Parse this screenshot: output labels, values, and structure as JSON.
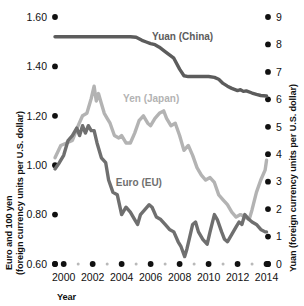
{
  "chart_data": {
    "type": "line",
    "title": "",
    "xlabel": "Year",
    "ylabel_left": "Euro and 100 yen (foreign currency units per U.S. dollar)",
    "ylabel_left_line1": "Euro and 100 yen",
    "ylabel_left_line2": "(foreign currency units per U.S. dollar)",
    "ylabel_right": "Yuan (foreign currency units per U.S. dollar)",
    "grid": false,
    "legend_position": "inline-annotations",
    "xlim": [
      1999.4,
      2014.1
    ],
    "x_major_ticks": [
      2000,
      2002,
      2004,
      2006,
      2008,
      2010,
      2012,
      2014
    ],
    "x_major_tick_labels": [
      "2000",
      "2002",
      "2004",
      "2006",
      "2008",
      "2010",
      "2012",
      "2014"
    ],
    "x_minor_ticks": [
      2001,
      2003,
      2005,
      2007,
      2009,
      2011,
      2013
    ],
    "x_edge_ticks": [
      1999.4,
      2014.1
    ],
    "ylim_left": [
      0.6,
      1.6
    ],
    "y_left_ticks": [
      0.6,
      0.8,
      1.0,
      1.2,
      1.4,
      1.6
    ],
    "y_left_tick_labels": [
      "0.60",
      "0.80",
      "1.00",
      "1.20",
      "1.40",
      "1.60"
    ],
    "ylim_right": [
      0,
      9
    ],
    "y_right_ticks": [
      0,
      1,
      2,
      3,
      4,
      5,
      6,
      7,
      8,
      9
    ],
    "y_right_tick_labels": [
      "0",
      "1",
      "2",
      "3",
      "4",
      "5",
      "6",
      "7",
      "8",
      "9"
    ],
    "series": [
      {
        "name": "Yuan (China)",
        "axis": "right",
        "color": "#5c5c5c",
        "label": "Yuan (China)",
        "label_x": 2006.1,
        "label_y": 8.15,
        "x": [
          1999.4,
          2000.0,
          2001.0,
          2002.0,
          2003.0,
          2004.0,
          2004.6,
          2005.0,
          2005.4,
          2005.7,
          2006.0,
          2006.3,
          2006.6,
          2007.0,
          2007.3,
          2007.6,
          2008.0,
          2008.3,
          2008.6,
          2009.0,
          2009.5,
          2010.0,
          2010.4,
          2010.7,
          2011.0,
          2011.3,
          2011.6,
          2012.0,
          2012.2,
          2012.4,
          2012.6,
          2013.0,
          2013.3,
          2013.6,
          2014.0
        ],
        "y": [
          8.28,
          8.28,
          8.28,
          8.28,
          8.28,
          8.28,
          8.28,
          8.26,
          8.15,
          8.09,
          8.03,
          7.99,
          7.9,
          7.74,
          7.62,
          7.5,
          7.1,
          6.86,
          6.83,
          6.83,
          6.83,
          6.83,
          6.8,
          6.73,
          6.58,
          6.48,
          6.4,
          6.32,
          6.35,
          6.29,
          6.31,
          6.23,
          6.18,
          6.14,
          6.12
        ]
      },
      {
        "name": "Yen (Japan)",
        "axis": "left",
        "color": "#b3b3b3",
        "label": "Yen (Japan)",
        "label_x": 2004.1,
        "label_y": 1.255,
        "x": [
          1999.4,
          1999.8,
          2000.2,
          2000.6,
          2001.0,
          2001.3,
          2001.6,
          2001.9,
          2002.1,
          2002.25,
          2002.4,
          2002.6,
          2002.8,
          2003.0,
          2003.2,
          2003.5,
          2003.8,
          2004.0,
          2004.3,
          2004.6,
          2004.9,
          2005.2,
          2005.5,
          2005.8,
          2006.0,
          2006.3,
          2006.6,
          2006.9,
          2007.1,
          2007.4,
          2007.7,
          2008.0,
          2008.3,
          2008.6,
          2008.9,
          2009.2,
          2009.5,
          2009.8,
          2010.1,
          2010.4,
          2010.7,
          2011.0,
          2011.3,
          2011.6,
          2011.9,
          2012.2,
          2012.5,
          2012.8,
          2013.0,
          2013.3,
          2013.6,
          2013.9,
          2014.0
        ],
        "y": [
          1.03,
          1.08,
          1.09,
          1.1,
          1.16,
          1.2,
          1.21,
          1.27,
          1.32,
          1.26,
          1.29,
          1.25,
          1.21,
          1.19,
          1.17,
          1.12,
          1.11,
          1.12,
          1.09,
          1.09,
          1.13,
          1.18,
          1.2,
          1.17,
          1.16,
          1.19,
          1.21,
          1.22,
          1.19,
          1.16,
          1.17,
          1.12,
          1.06,
          1.08,
          1.04,
          0.99,
          0.96,
          0.94,
          0.95,
          0.93,
          0.88,
          0.86,
          0.84,
          0.81,
          0.79,
          0.8,
          0.79,
          0.78,
          0.82,
          0.89,
          0.94,
          0.98,
          1.02
        ]
      },
      {
        "name": "Euro (EU)",
        "axis": "left",
        "color": "#6f6f6f",
        "label": "Euro (EU)",
        "label_x": 2003.6,
        "label_y": 0.915,
        "x": [
          1999.4,
          1999.7,
          2000.0,
          2000.3,
          2000.6,
          2000.9,
          2001.1,
          2001.3,
          2001.5,
          2001.7,
          2001.9,
          2002.1,
          2002.3,
          2002.6,
          2002.9,
          2003.1,
          2003.4,
          2003.7,
          2004.0,
          2004.3,
          2004.6,
          2004.9,
          2005.1,
          2005.3,
          2005.6,
          2005.9,
          2006.1,
          2006.4,
          2006.7,
          2007.0,
          2007.3,
          2007.6,
          2007.9,
          2008.1,
          2008.35,
          2008.5,
          2008.7,
          2008.9,
          2009.1,
          2009.3,
          2009.6,
          2009.9,
          2010.1,
          2010.4,
          2010.6,
          2010.9,
          2011.1,
          2011.3,
          2011.6,
          2011.9,
          2012.1,
          2012.3,
          2012.5,
          2012.8,
          2013.0,
          2013.3,
          2013.6,
          2013.9,
          2014.0
        ],
        "y": [
          0.985,
          1.01,
          1.04,
          1.1,
          1.12,
          1.15,
          1.12,
          1.16,
          1.13,
          1.16,
          1.14,
          1.14,
          1.09,
          1.03,
          1.01,
          0.94,
          0.89,
          0.88,
          0.8,
          0.83,
          0.81,
          0.78,
          0.76,
          0.8,
          0.82,
          0.84,
          0.83,
          0.79,
          0.78,
          0.76,
          0.74,
          0.73,
          0.69,
          0.67,
          0.63,
          0.66,
          0.71,
          0.76,
          0.77,
          0.73,
          0.7,
          0.68,
          0.73,
          0.8,
          0.78,
          0.73,
          0.7,
          0.69,
          0.72,
          0.75,
          0.77,
          0.76,
          0.8,
          0.78,
          0.77,
          0.76,
          0.74,
          0.73,
          0.73
        ]
      }
    ]
  },
  "axes": {
    "x_axis_title": "Year",
    "left_title_line1": "Euro and 100 yen",
    "left_title_line2": "(foreign currency units per U.S. dollar)",
    "right_title": "Yuan (foreign currency units per U.S. dollar)"
  },
  "colors": {
    "yuan": "#5c5c5c",
    "yen": "#b3b3b3",
    "euro": "#6f6f6f",
    "text": "#111111",
    "minor_tick": "#b9b9b9",
    "background": "#ffffff"
  }
}
